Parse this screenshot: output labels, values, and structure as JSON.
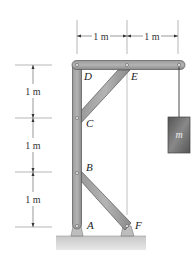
{
  "diagram": {
    "dimensions": {
      "top": [
        "1 m",
        "1 m"
      ],
      "left": [
        "1 m",
        "1 m",
        "1 m"
      ]
    },
    "points": {
      "A": "A",
      "B": "B",
      "C": "C",
      "D": "D",
      "E": "E",
      "F": "F"
    },
    "mass_label": "m",
    "colors": {
      "member_fill": "#8c8c8c",
      "member_stroke": "#555555",
      "ground": "#cfcfcf",
      "mass": "#6e6e6e"
    }
  }
}
